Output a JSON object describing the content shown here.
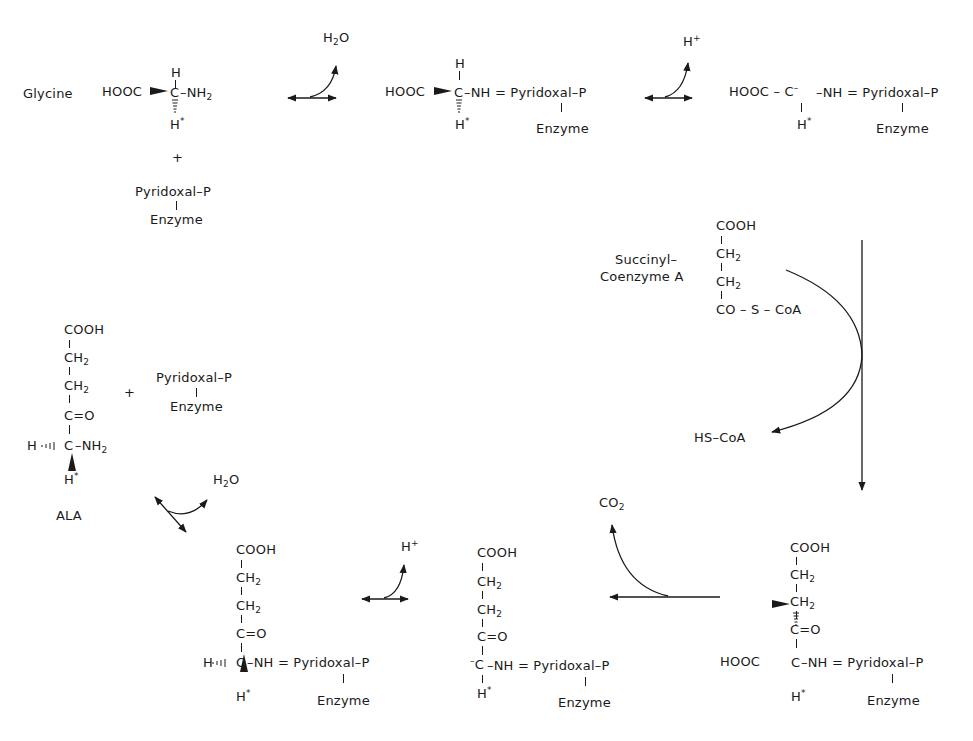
{
  "labels": {
    "glycine": "Glycine",
    "succinyl": "Succinyl–",
    "coenzyme_a": "Coenzyme A",
    "ala": "ALA"
  },
  "byproducts": {
    "h2o_top": {
      "main": "H",
      "sub": "2",
      "tail": "O"
    },
    "hplus_top": {
      "main": "H",
      "sup": "+"
    },
    "hs_coa": "HS–CoA",
    "co2": {
      "main": "CO",
      "sub": "2"
    },
    "hplus_bottom": {
      "main": "H",
      "sup": "+"
    },
    "h2o_left": {
      "main": "H",
      "sub": "2",
      "tail": "O"
    }
  },
  "common": {
    "hooc": "HOOC",
    "cooh": "COOH",
    "ch": "CH",
    "two": "2",
    "c_eq_o": "C=O",
    "c": "C",
    "h": "H",
    "star": "*",
    "nh2": "–NH",
    "nh_eq": "–NH = Pyridoxal–P",
    "pyridoxal": "Pyridoxal–P",
    "enzyme": "Enzyme",
    "plus": "+",
    "minus": "–",
    "co_s_coa": "CO – S – CoA",
    "hooc_dash_c": "HOOC – C",
    "h_dash": "H"
  },
  "structures": [
    {
      "id": "glycine",
      "formula": "HOOC–CH(H*)–NH2"
    },
    {
      "id": "schiff-base",
      "formula": "HOOC–CH(H*)–NH=Pyridoxal-P–Enzyme"
    },
    {
      "id": "carbanion",
      "formula": "HOOC–C(-)(H*)–NH=Pyridoxal-P–Enzyme"
    },
    {
      "id": "succinyl-coa",
      "formula": "COOH–CH2–CH2–CO–S–CoA"
    },
    {
      "id": "condensation-intermediate",
      "formula": "COOH–CH2–CH2–C=O–C(HOOC)(H*)–NH=Pyridoxal-P–Enzyme"
    },
    {
      "id": "decarboxylated-carbanion",
      "formula": "COOH–CH2–CH2–C=O–C(-)(H*)–NH=Pyridoxal-P–Enzyme"
    },
    {
      "id": "ala-schiff-base",
      "formula": "COOH–CH2–CH2–C=O–CH(H*)–NH=Pyridoxal-P–Enzyme"
    },
    {
      "id": "ala",
      "formula": "COOH–CH2–CH2–C=O–CH(H*)–NH2"
    }
  ],
  "colors": {
    "ink": "#1a1a1a",
    "background": "#ffffff"
  }
}
